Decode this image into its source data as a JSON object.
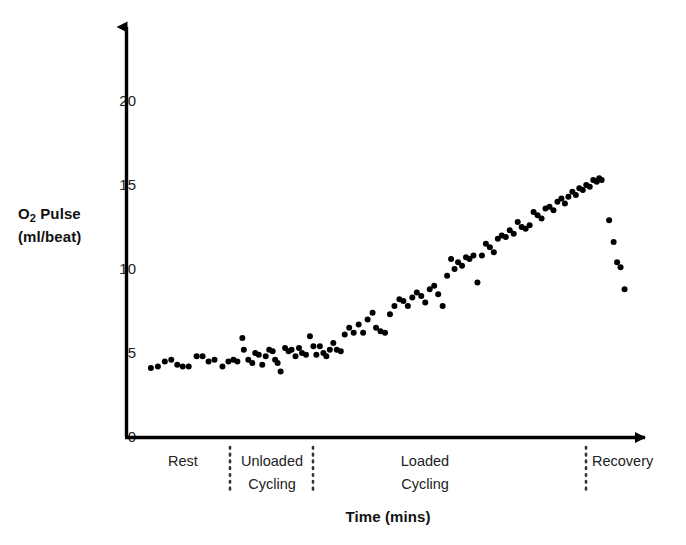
{
  "chart_data": {
    "type": "scatter",
    "title": "",
    "xlabel": "Time (mins)",
    "ylabel": "O2 Pulse (ml/beat)",
    "ylabel_line1": "O",
    "ylabel_sub": "2",
    "ylabel_line1_rest": " Pulse",
    "ylabel_line2": "(ml/beat)",
    "ylim": [
      0,
      23
    ],
    "yticks": [
      0,
      5,
      10,
      15,
      20
    ],
    "ytick_labels": [
      "0",
      "5",
      "10",
      "15",
      "20"
    ],
    "xlim": [
      0,
      100
    ],
    "grid": false,
    "legend": "none",
    "marker": "filled-circle",
    "marker_color": "#000000",
    "marker_size_px": 6,
    "axis_color": "#000000",
    "background": "#ffffff",
    "phases": [
      {
        "name": "Rest",
        "label": "Rest",
        "x_start": 0,
        "x_end": 21
      },
      {
        "name": "Unloaded Cycling",
        "label": "Unloaded\nCycling",
        "x_start": 21,
        "x_end": 38
      },
      {
        "name": "Loaded Cycling",
        "label": "Loaded\nCycling",
        "x_start": 38,
        "x_end": 94
      },
      {
        "name": "Recovery",
        "label": "Recovery",
        "x_start": 94,
        "x_end": 100
      }
    ],
    "phase_dividers_x": [
      21,
      38,
      94
    ],
    "points": [
      [
        3.2,
        4.1
      ],
      [
        4.6,
        4.2
      ],
      [
        6.0,
        4.5
      ],
      [
        7.3,
        4.6
      ],
      [
        8.5,
        4.3
      ],
      [
        9.6,
        4.2
      ],
      [
        10.8,
        4.2
      ],
      [
        12.4,
        4.8
      ],
      [
        13.6,
        4.8
      ],
      [
        14.8,
        4.5
      ],
      [
        16.0,
        4.6
      ],
      [
        17.6,
        4.2
      ],
      [
        18.8,
        4.5
      ],
      [
        19.8,
        4.6
      ],
      [
        20.6,
        4.5
      ],
      [
        21.6,
        5.9
      ],
      [
        21.9,
        5.2
      ],
      [
        22.8,
        4.6
      ],
      [
        23.6,
        4.4
      ],
      [
        24.2,
        5.0
      ],
      [
        24.9,
        4.9
      ],
      [
        25.6,
        4.3
      ],
      [
        26.3,
        4.8
      ],
      [
        27.0,
        5.2
      ],
      [
        27.7,
        5.1
      ],
      [
        28.2,
        4.6
      ],
      [
        28.7,
        4.4
      ],
      [
        29.3,
        3.9
      ],
      [
        30.2,
        5.3
      ],
      [
        30.9,
        5.1
      ],
      [
        31.5,
        5.2
      ],
      [
        32.3,
        4.8
      ],
      [
        33.0,
        5.3
      ],
      [
        33.6,
        5.0
      ],
      [
        34.4,
        4.9
      ],
      [
        35.2,
        6.0
      ],
      [
        35.9,
        5.4
      ],
      [
        36.5,
        4.9
      ],
      [
        37.2,
        5.4
      ],
      [
        37.9,
        5.0
      ],
      [
        38.5,
        4.8
      ],
      [
        39.2,
        5.2
      ],
      [
        39.9,
        5.6
      ],
      [
        40.6,
        5.2
      ],
      [
        41.4,
        5.1
      ],
      [
        42.2,
        6.1
      ],
      [
        43.1,
        6.5
      ],
      [
        44.0,
        6.2
      ],
      [
        45.0,
        6.7
      ],
      [
        45.9,
        6.2
      ],
      [
        46.8,
        7.0
      ],
      [
        47.8,
        7.4
      ],
      [
        48.5,
        6.5
      ],
      [
        49.4,
        6.3
      ],
      [
        50.3,
        6.2
      ],
      [
        51.3,
        7.3
      ],
      [
        52.2,
        7.8
      ],
      [
        53.2,
        8.2
      ],
      [
        54.0,
        8.1
      ],
      [
        54.9,
        7.8
      ],
      [
        55.8,
        8.3
      ],
      [
        56.7,
        8.6
      ],
      [
        57.6,
        8.4
      ],
      [
        58.4,
        8.0
      ],
      [
        59.3,
        8.8
      ],
      [
        60.2,
        9.0
      ],
      [
        61.0,
        8.5
      ],
      [
        61.9,
        7.8
      ],
      [
        62.8,
        9.6
      ],
      [
        63.6,
        10.6
      ],
      [
        64.3,
        10.0
      ],
      [
        65.0,
        10.4
      ],
      [
        65.8,
        10.2
      ],
      [
        66.6,
        10.7
      ],
      [
        67.3,
        10.6
      ],
      [
        68.1,
        10.8
      ],
      [
        68.9,
        9.2
      ],
      [
        69.8,
        10.8
      ],
      [
        70.6,
        11.5
      ],
      [
        71.4,
        11.3
      ],
      [
        72.2,
        11.0
      ],
      [
        73.0,
        11.8
      ],
      [
        73.8,
        12.0
      ],
      [
        74.6,
        11.9
      ],
      [
        75.4,
        12.3
      ],
      [
        76.2,
        12.1
      ],
      [
        77.0,
        12.8
      ],
      [
        77.8,
        12.5
      ],
      [
        78.6,
        12.4
      ],
      [
        79.4,
        12.6
      ],
      [
        80.2,
        13.4
      ],
      [
        81.0,
        13.2
      ],
      [
        81.8,
        13.0
      ],
      [
        82.6,
        13.6
      ],
      [
        83.4,
        13.7
      ],
      [
        84.2,
        13.5
      ],
      [
        85.0,
        14.0
      ],
      [
        85.8,
        14.2
      ],
      [
        86.5,
        13.9
      ],
      [
        87.2,
        14.3
      ],
      [
        88.0,
        14.6
      ],
      [
        88.7,
        14.4
      ],
      [
        89.4,
        14.8
      ],
      [
        90.1,
        14.7
      ],
      [
        90.8,
        15.0
      ],
      [
        91.5,
        14.9
      ],
      [
        92.2,
        15.3
      ],
      [
        92.9,
        15.2
      ],
      [
        93.4,
        15.4
      ],
      [
        93.9,
        15.3
      ],
      [
        95.4,
        12.9
      ],
      [
        96.3,
        11.6
      ],
      [
        97.0,
        10.4
      ],
      [
        97.7,
        10.1
      ],
      [
        98.5,
        8.8
      ]
    ],
    "annotations": [
      "Rest phase: O2 pulse stable near 4-5 ml/beat",
      "Unloaded cycling: slight rise, scatter around 5 ml/beat",
      "Loaded cycling: progressive rise from ~5 to ~15.5 ml/beat",
      "Recovery: rapid fall from ~13 to ~8.8 ml/beat"
    ]
  }
}
